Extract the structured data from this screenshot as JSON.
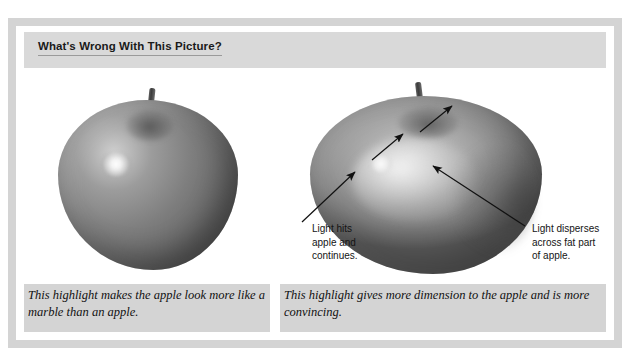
{
  "figure": {
    "title": "What's Wrong With This Picture?",
    "background_color": "#d4d4d4",
    "title_band_color": "#d9d9d9",
    "panel_background": "#ffffff"
  },
  "panels": [
    {
      "id": "left",
      "image_subject": "apple-grayscale-tight-highlight",
      "caption": "This highlight makes the apple look more like a marble than an apple.",
      "annotations": []
    },
    {
      "id": "right",
      "image_subject": "apple-grayscale-diffuse-highlight",
      "caption": "This highlight gives more dimension to the apple and is more convincing.",
      "annotations": [
        {
          "id": "light-hits",
          "text": "Light hits\napple and\ncontinues.",
          "arrow": "points up-right toward highlight and stem"
        },
        {
          "id": "light-disperses",
          "text": "Light disperses\nacross fat part\nof apple.",
          "arrow": "points up-left toward fat part of apple"
        }
      ]
    }
  ]
}
